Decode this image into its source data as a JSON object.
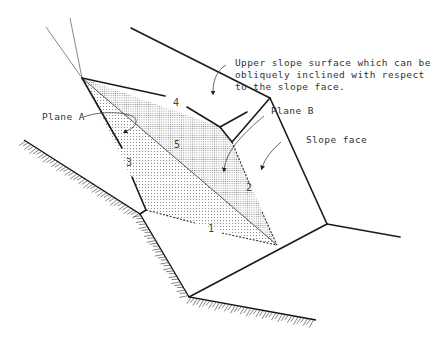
{
  "figure": {
    "labels": {
      "upper_slope": [
        "Upper slope surface which can be",
        "obliquely inclined with respect",
        "to the slope face."
      ],
      "plane_a": "Plane A",
      "plane_b": "Plane B",
      "slope_face": "Slope face"
    },
    "line_numbers": [
      "1",
      "2",
      "3",
      "4",
      "5"
    ],
    "colors": {
      "line": "#1a1a1a",
      "text": "#333333",
      "plane_a_fill": "#d9d9d9",
      "plane_b_fill": "#c8c8c8"
    }
  }
}
